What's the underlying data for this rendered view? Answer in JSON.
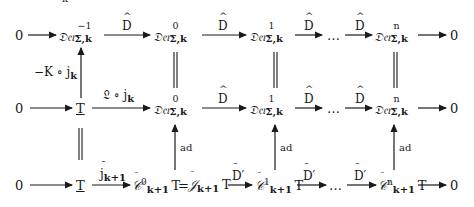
{
  "diagram": {
    "type": "commutative_diagram",
    "top_fragment": "k",
    "row1": {
      "start": "0",
      "nodes": [
        {
          "base": "𝔇𝔢𝔯",
          "sup": "−1",
          "sub": "Σ,k"
        },
        {
          "base": "𝔇𝔢𝔯",
          "sup": "0",
          "sub": "Σ,k"
        },
        {
          "base": "𝔇𝔢𝔯",
          "sup": "1",
          "sub": "Σ,k"
        },
        {
          "base": "𝔇𝔢𝔯",
          "sup": "n",
          "sub": "Σ,k"
        }
      ],
      "arrow_labels": [
        "D",
        "D",
        "D",
        "D"
      ],
      "ellipsis": "…",
      "end": "0"
    },
    "row2": {
      "start": "0",
      "T": "T",
      "first_arrow_label": "𝔏 ∘ j",
      "first_arrow_sub": "k",
      "nodes": [
        {
          "base": "𝔇𝔢𝔯",
          "sup": "0",
          "sub": "Σ,k"
        },
        {
          "base": "𝔇𝔢𝔯",
          "sup": "1",
          "sub": "Σ,k"
        },
        {
          "base": "𝔇𝔢𝔯",
          "sup": "n",
          "sub": "Σ,k"
        }
      ],
      "arrow_labels": [
        "D",
        "D",
        "D"
      ],
      "ellipsis": "…",
      "end": "0"
    },
    "row3": {
      "start": "0",
      "T": "T",
      "first_arrow_label": "j",
      "first_arrow_sub": "k+1",
      "c0": {
        "base": "𝒞",
        "sup": "0",
        "sub": "k+1",
        "suffix": "T"
      },
      "equals": "=",
      "g": {
        "base": "𝒥",
        "sub": "k+1",
        "suffix": "T"
      },
      "c1": {
        "base": "𝒞",
        "sup": "1",
        "sub": "k+1",
        "suffix": "T"
      },
      "cn": {
        "base": "𝒞",
        "sup": "n",
        "sub": "k+1",
        "suffix": "T"
      },
      "arrow_labels": [
        "D′",
        "D′",
        "D′"
      ],
      "ellipsis": "…",
      "end": "0"
    },
    "vertical": {
      "left_label": "−K ∘ j",
      "left_label_sub": "k",
      "ad_label": "ad"
    }
  }
}
